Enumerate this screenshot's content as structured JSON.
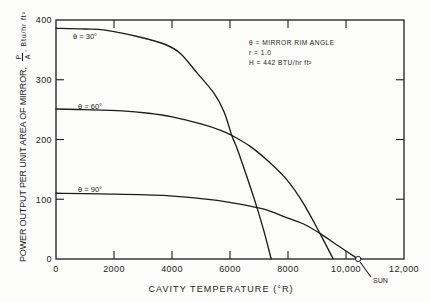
{
  "chart_data": {
    "type": "line",
    "title": "",
    "xlabel": "CAVITY TEMPERATURE (°R)",
    "ylabel": {
      "text": "POWER OUTPUT PER UNIT AREA OF MIRROR,",
      "fraction_numerator": "P",
      "fraction_denominator": "A",
      "units": ", Btu/hr ft²"
    },
    "xlim": [
      0,
      12000
    ],
    "ylim": [
      0,
      400
    ],
    "xticks": [
      0,
      2000,
      4000,
      6000,
      8000,
      10000,
      12000
    ],
    "xtick_labels": [
      "0",
      "2000",
      "4000",
      "6000",
      "8000",
      "10,000",
      "12,000"
    ],
    "yticks": [
      0,
      100,
      200,
      300,
      400
    ],
    "ytick_labels": [
      "0",
      "100",
      "200",
      "300",
      "400"
    ],
    "grid": false,
    "legend_position": "upper right (text block)",
    "legend_box": {
      "lines": [
        "θ = MIRROR RIM ANGLE",
        "r = 1.0",
        "H = 442 BTU/hr ft²"
      ]
    },
    "series": [
      {
        "name": "theta-30",
        "label": "θ = 30°",
        "x": [
          0,
          1000,
          1700,
          2840,
          3770,
          4290,
          4870,
          5440,
          5790,
          6060,
          6250,
          6600,
          6930,
          7180,
          7420
        ],
        "y": [
          386,
          385,
          383,
          372,
          359,
          344,
          311,
          278,
          247,
          207,
          184,
          135,
          86,
          45,
          0
        ]
      },
      {
        "name": "theta-60",
        "label": "θ = 60°",
        "x": [
          0,
          1000,
          2280,
          3200,
          4010,
          5000,
          5700,
          6060,
          6710,
          7380,
          7970,
          8520,
          9100,
          9560
        ],
        "y": [
          251,
          250,
          248,
          244,
          238,
          226,
          215,
          207,
          188,
          161,
          132,
          94,
          43,
          0
        ]
      },
      {
        "name": "theta-90",
        "label": "θ = 90°",
        "x": [
          0,
          1520,
          3830,
          5560,
          6940,
          7380,
          7970,
          8520,
          9100,
          9700,
          10420
        ],
        "y": [
          110,
          109,
          106,
          98,
          86,
          80,
          69,
          59,
          43,
          23,
          0
        ]
      }
    ],
    "annotations": [
      {
        "text": "SUN",
        "x": 10420,
        "y": 0,
        "marker": "open-circle"
      }
    ]
  }
}
